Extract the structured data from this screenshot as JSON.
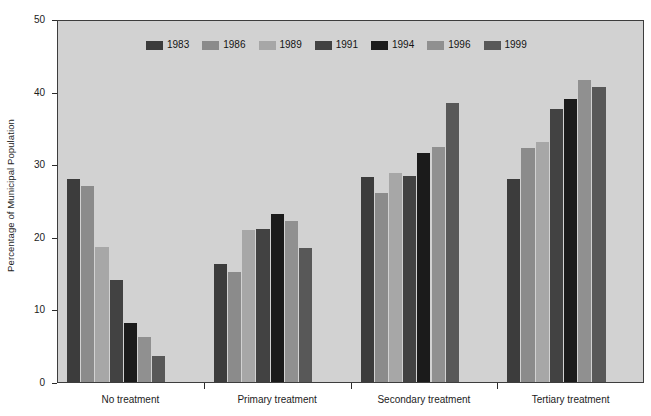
{
  "chart_data": {
    "type": "bar",
    "title": "",
    "subtitle": "",
    "xlabel": "",
    "ylabel": "Percentage of Municipal Population",
    "ylim": [
      0,
      50
    ],
    "ytick_values": [
      0,
      10,
      20,
      30,
      40,
      50
    ],
    "ytick_labels": [
      "0",
      "10",
      "20",
      "30",
      "40",
      "50"
    ],
    "grid": false,
    "legend_position": "top-center-inside",
    "categories": [
      "No treatment",
      "Primary treatment",
      "Secondary treatment",
      "Tertiary treatment"
    ],
    "series": [
      {
        "name": "1983",
        "color": "#3c3c3c",
        "values": [
          28.0,
          16.2,
          28.3,
          28.0
        ]
      },
      {
        "name": "1986",
        "color": "#8b8b8b",
        "values": [
          27.0,
          15.1,
          26.1,
          32.2
        ]
      },
      {
        "name": "1989",
        "color": "#a7a7a7",
        "values": [
          18.6,
          20.9,
          28.8,
          33.1
        ]
      },
      {
        "name": "1991",
        "color": "#424242",
        "values": [
          14.1,
          21.1,
          28.4,
          37.6
        ]
      },
      {
        "name": "1994",
        "color": "#1b1b1b",
        "values": [
          8.1,
          23.2,
          31.6,
          39.0
        ]
      },
      {
        "name": "1996",
        "color": "#909090",
        "values": [
          6.2,
          22.2,
          32.4,
          41.6
        ]
      },
      {
        "name": "1999",
        "color": "#585858",
        "values": [
          3.6,
          18.4,
          38.5,
          40.7
        ]
      }
    ]
  },
  "axes": {
    "y_title": "Percentage of Municipal Population"
  },
  "colors": {
    "plot_background": "#d2d2d2",
    "page_background": "#ffffff",
    "axis_line": "#3d3d3d",
    "text": "#1c1c1c"
  }
}
